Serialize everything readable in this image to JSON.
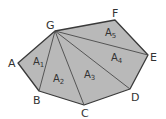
{
  "diagram": {
    "colors": {
      "fill": "#b9b9b9",
      "stroke": "#3a3a3a",
      "text": "#333333"
    },
    "vertices": [
      {
        "name": "A",
        "x": 18,
        "y": 63,
        "label_x": 8,
        "label_y": 67
      },
      {
        "name": "B",
        "x": 39,
        "y": 91,
        "label_x": 33,
        "label_y": 104
      },
      {
        "name": "C",
        "x": 84,
        "y": 105,
        "label_x": 81,
        "label_y": 117
      },
      {
        "name": "D",
        "x": 130,
        "y": 89,
        "label_x": 131,
        "label_y": 101
      },
      {
        "name": "E",
        "x": 148,
        "y": 55,
        "label_x": 150,
        "label_y": 61
      },
      {
        "name": "F",
        "x": 115,
        "y": 20,
        "label_x": 112,
        "label_y": 17
      },
      {
        "name": "G",
        "x": 55,
        "y": 31,
        "label_x": 46,
        "label_y": 29
      }
    ],
    "diagonals": [
      {
        "from": "G",
        "to": "B"
      },
      {
        "from": "G",
        "to": "C"
      },
      {
        "from": "G",
        "to": "D"
      },
      {
        "from": "G",
        "to": "E"
      }
    ],
    "regions": [
      {
        "name": "A",
        "sub": "1",
        "x": 33,
        "y": 65
      },
      {
        "name": "A",
        "sub": "2",
        "x": 53,
        "y": 82
      },
      {
        "name": "A",
        "sub": "3",
        "x": 84,
        "y": 78
      },
      {
        "name": "A",
        "sub": "4",
        "x": 111,
        "y": 61
      },
      {
        "name": "A",
        "sub": "5",
        "x": 105,
        "y": 36
      }
    ]
  }
}
